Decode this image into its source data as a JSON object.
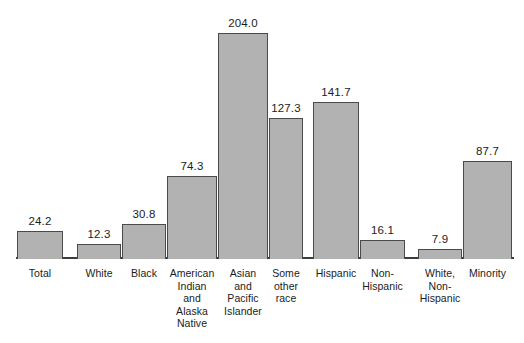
{
  "chart_data": {
    "type": "bar",
    "title": "",
    "subtitle": "",
    "xlabel": "",
    "ylabel": "",
    "ylim": [
      0,
      204
    ],
    "grid": false,
    "legend": "none",
    "axis_visible": "baseline-only",
    "value_label_format": "one-decimal",
    "categories": [
      "Total",
      "White",
      "Black",
      "American\nIndian\nand\nAlaska\nNative",
      "Asian\nand\nPacific\nIslander",
      "Some\nother\nrace",
      "Hispanic",
      "Non-\nHispanic",
      "White,\nNon-\nHispanic",
      "Minority"
    ],
    "values": [
      24.2,
      12.3,
      30.8,
      74.3,
      204.0,
      127.3,
      141.7,
      16.1,
      7.9,
      87.7
    ],
    "value_labels": [
      "24.2",
      "12.3",
      "30.8",
      "74.3",
      "204.0",
      "127.3",
      "141.7",
      "16.1",
      "7.9",
      "87.7"
    ],
    "groups": [
      {
        "name": "race",
        "categories": [
          "Total",
          "White",
          "Black",
          "American Indian and Alaska Native",
          "Asian and Pacific Islander",
          "Some other race"
        ]
      },
      {
        "name": "ethnicity",
        "categories": [
          "Hispanic",
          "Non-Hispanic"
        ]
      },
      {
        "name": "combined",
        "categories": [
          "White, Non-Hispanic",
          "Minority"
        ]
      }
    ],
    "colors": {
      "bar_fill": "#b2b2b2",
      "bar_stroke": "#4a4a4a",
      "axis": "#3d3d3d",
      "text": "#1c1c1c",
      "background": "#ffffff"
    }
  },
  "geometry": {
    "baseline_y": 258,
    "max_bar_height": 225,
    "bars": [
      {
        "x": 17,
        "w": 46,
        "label_w": 46
      },
      {
        "x": 77,
        "w": 44,
        "label_w": 44
      },
      {
        "x": 122,
        "w": 44,
        "label_w": 56
      },
      {
        "x": 167,
        "w": 50,
        "label_w": 58
      },
      {
        "x": 218,
        "w": 50,
        "label_w": 56
      },
      {
        "x": 269,
        "w": 34,
        "label_w": 50
      },
      {
        "x": 313,
        "w": 46,
        "label_w": 52
      },
      {
        "x": 360,
        "w": 45,
        "label_w": 50
      },
      {
        "x": 418,
        "w": 44,
        "label_w": 52
      },
      {
        "x": 463,
        "w": 49,
        "label_w": 52
      }
    ]
  }
}
